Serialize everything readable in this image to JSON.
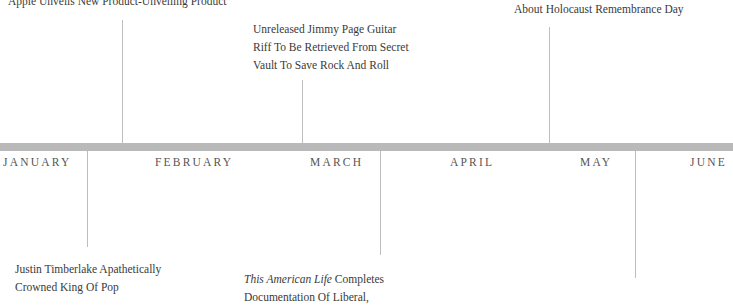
{
  "timeline": {
    "months": [
      "JANUARY",
      "FEBRUARY",
      "MARCH",
      "APRIL",
      "MAY",
      "JUNE"
    ],
    "events_above": [
      {
        "lines": [
          "Apple Unveils New Product-Unveiling Product"
        ]
      },
      {
        "lines": [
          "Unreleased Jimmy Page Guitar",
          "Riff To Be Retrieved From Secret",
          "Vault To Save Rock And Roll"
        ]
      },
      {
        "lines": [
          "About Holocaust Remembrance Day"
        ]
      }
    ],
    "events_below": [
      {
        "lines": [
          "Justin Timberlake Apathetically",
          "Crowned King Of Pop"
        ]
      },
      {
        "italic": "This American Life",
        "rest": " Completes",
        "lines": [
          "Documentation Of Liberal,"
        ]
      }
    ],
    "colors": {
      "bar": "#b9b9b9",
      "connector": "#bdbdbd",
      "text": "#3a3a3a"
    }
  }
}
